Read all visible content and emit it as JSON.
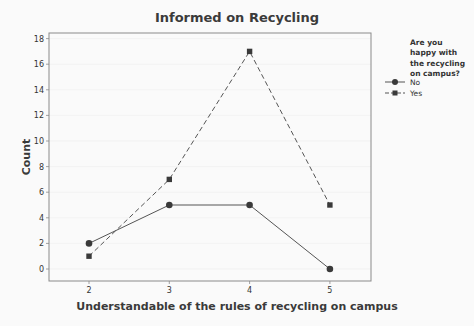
{
  "chart_data": {
    "type": "line",
    "title": "Informed on Recycling",
    "xlabel": "Understandable of the rules of recycling on campus",
    "ylabel": "Count",
    "x": [
      2,
      3,
      4,
      5
    ],
    "xticks": [
      "2",
      "3",
      "4",
      "5"
    ],
    "yticks": [
      "0",
      "2",
      "4",
      "6",
      "8",
      "10",
      "12",
      "14",
      "16",
      "18"
    ],
    "ylim": [
      -1,
      18.5
    ],
    "grid": true,
    "legend_position": "right",
    "legend_title": [
      "Are you",
      "happy with",
      "the recycling",
      "on campus?"
    ],
    "series": [
      {
        "name": "No",
        "values": [
          2,
          5,
          5,
          0
        ],
        "marker": "circle",
        "line": "solid"
      },
      {
        "name": "Yes",
        "values": [
          1,
          7,
          17,
          5
        ],
        "marker": "square",
        "line": "dashed"
      }
    ]
  },
  "colors": {
    "line": "#555555",
    "marker": "#3a3a3a",
    "frame": "#8a8a8a",
    "grid": "#ececec"
  }
}
